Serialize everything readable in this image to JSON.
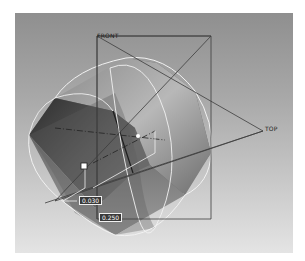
{
  "viewport": {
    "background_top": "#8f8f8f",
    "background_bottom": "#e4e4e4"
  },
  "datum_planes": {
    "front_label": "FRONT",
    "top_label": "TOP"
  },
  "dimensions": [
    {
      "value": "0.030"
    },
    {
      "value": "0.250"
    }
  ],
  "colors": {
    "edge_highlight": "#f2f2f2",
    "datum_line": "#3c3c3c",
    "model_dark": "#3d3d3d",
    "model_light": "#b5b5b5"
  }
}
